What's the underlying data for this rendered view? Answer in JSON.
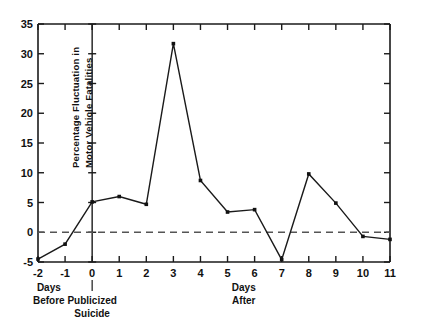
{
  "chart_data": {
    "type": "line",
    "title": "",
    "subtitle": "",
    "xlabel": "",
    "ylabel": "Percentage Fluctuation in Motor Vehicle Fatalities",
    "ylabel_lines": [
      "Percentage Fluctuation in",
      "Motor Vehicle Fatalities"
    ],
    "x": [
      -2,
      -1,
      0,
      1,
      2,
      3,
      4,
      5,
      6,
      7,
      8,
      9,
      10,
      11
    ],
    "values": [
      -4.5,
      -2.0,
      5.1,
      6.0,
      4.7,
      31.7,
      8.7,
      3.4,
      3.8,
      -4.6,
      9.8,
      4.9,
      -0.7,
      -1.2
    ],
    "series": [
      {
        "name": "Percentage fluctuation in motor vehicle fatalities",
        "values": [
          -4.5,
          -2.0,
          5.1,
          6.0,
          4.7,
          31.7,
          8.7,
          3.4,
          3.8,
          -4.6,
          9.8,
          4.9,
          -0.7,
          -1.2
        ]
      }
    ],
    "xlim": [
      -2,
      11
    ],
    "ylim": [
      -5,
      35
    ],
    "xticks": [
      -2,
      -1,
      0,
      1,
      2,
      3,
      4,
      5,
      6,
      7,
      8,
      9,
      10,
      11
    ],
    "xtick_labels": [
      "-2",
      "-1",
      "0",
      "1",
      "2",
      "3",
      "4",
      "5",
      "6",
      "7",
      "8",
      "9",
      "10",
      "11"
    ],
    "yticks": [
      -5,
      0,
      5,
      10,
      15,
      20,
      25,
      30,
      35
    ],
    "ytick_labels": [
      "-5",
      "0",
      "5",
      "10",
      "15",
      "20",
      "25",
      "30",
      "35"
    ],
    "grid": false,
    "legend": null,
    "legend_position": "none",
    "markers": "square",
    "reference_lines": [
      {
        "name": "zero-horizontal",
        "axis": "y",
        "value": 0,
        "style": "dashed"
      },
      {
        "name": "publicized-suicide-day",
        "axis": "x",
        "value": 0,
        "style": "solid"
      }
    ],
    "annotations": [
      {
        "name": "days-before",
        "lines": [
          "Days",
          "Before"
        ],
        "x": -1.6
      },
      {
        "name": "publicized-suicide",
        "lines": [
          "Publicized",
          "Suicide"
        ],
        "x": 0
      },
      {
        "name": "days-after",
        "lines": [
          "Days",
          "After"
        ],
        "x": 5.6
      }
    ]
  },
  "annotations": {
    "days_before_line1": "Days",
    "days_before_line2": "Before",
    "publicized_line1": "Publicized",
    "publicized_line2": "Suicide",
    "days_after_line1": "Days",
    "days_after_line2": "After"
  },
  "axis": {
    "ylabel_line1": "Percentage Fluctuation in",
    "ylabel_line2": "Motor Vehicle Fatalities"
  },
  "colors": {
    "line": "#1a1a1a",
    "marker": "#111111",
    "reference": "#555555",
    "background": "#ffffff"
  }
}
